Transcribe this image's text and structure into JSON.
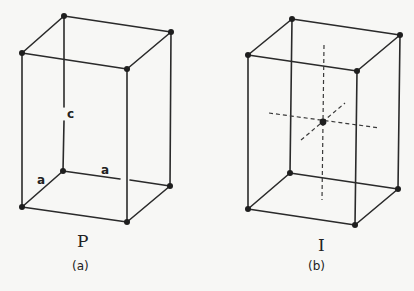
{
  "figure": {
    "panels": [
      {
        "id": "a",
        "lattice_type": "P",
        "caption": "(a)",
        "edge_labels": {
          "vertical": "c",
          "left_base": "a",
          "back_base": "a"
        },
        "body_center_atom": false
      },
      {
        "id": "b",
        "lattice_type": "I",
        "caption": "(b)",
        "edge_labels": {},
        "body_center_atom": true
      }
    ],
    "colors": {
      "line": "#2a2a2a",
      "atom": "#1e1e1e",
      "background": "#f7f7f5"
    }
  }
}
